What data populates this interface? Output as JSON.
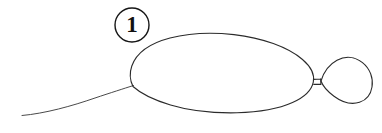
{
  "figure": {
    "background_color": "#ffffff",
    "ink_color": "#2b2b2b",
    "callout": {
      "label": "1",
      "shape": "circle",
      "center_x": 132,
      "center_y": 25,
      "radius": 17,
      "ring_color": "#161616",
      "label_color": "#111111"
    },
    "parts": [
      {
        "name": "body-outline",
        "description": "large oval body outline",
        "bounds": {
          "x": 129,
          "y": 33,
          "width": 185,
          "height": 80
        }
      },
      {
        "name": "tail-curve",
        "description": "thin curved tail sweeping to lower left",
        "bounds": {
          "x": 22,
          "y": 84,
          "width": 113,
          "height": 32
        }
      },
      {
        "name": "connector-stem",
        "description": "short stem joining body to teardrop",
        "bounds": {
          "x": 313,
          "y": 79,
          "width": 8,
          "height": 6
        }
      },
      {
        "name": "teardrop-appendage",
        "description": "small teardrop shape attached at right",
        "bounds": {
          "x": 320,
          "y": 57,
          "width": 52,
          "height": 47
        }
      }
    ]
  }
}
